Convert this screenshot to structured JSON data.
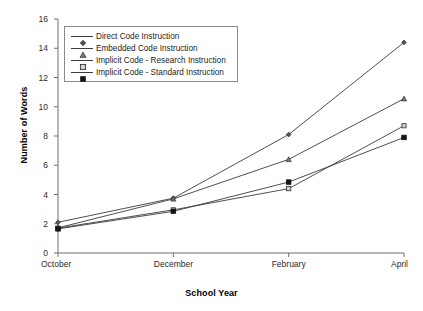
{
  "chart_data": {
    "type": "line",
    "title": "",
    "xlabel": "School Year",
    "ylabel": "Number of Words",
    "categories": [
      "October",
      "December",
      "February",
      "April"
    ],
    "ylim": [
      0,
      16
    ],
    "yticks": [
      0,
      2,
      4,
      6,
      8,
      10,
      12,
      14,
      16
    ],
    "grid": false,
    "legend_position": "upper-left-inside",
    "series": [
      {
        "name": "Direct Code Instruction",
        "marker": "diamond",
        "values": [
          2.1,
          3.75,
          8.1,
          14.4
        ]
      },
      {
        "name": "Embedded Code Instruction",
        "marker": "triangle",
        "values": [
          1.72,
          3.7,
          6.4,
          10.55
        ]
      },
      {
        "name": "Implicit Code - Research Instruction",
        "marker": "open-square",
        "values": [
          1.7,
          2.95,
          4.4,
          8.7
        ]
      },
      {
        "name": "Implicit Code - Standard Instruction",
        "marker": "filled-square",
        "values": [
          1.65,
          2.85,
          4.85,
          7.9
        ]
      }
    ]
  },
  "axes": {
    "y_label": "Number of Words",
    "x_label": "School Year",
    "y_tick_labels": [
      "0",
      "2",
      "4",
      "6",
      "8",
      "10",
      "12",
      "14",
      "16"
    ],
    "x_tick_labels": [
      "October",
      "December",
      "February",
      "April"
    ]
  },
  "legend": {
    "entries": [
      {
        "label": "Direct Code Instruction",
        "marker": "diamond-marker-icon"
      },
      {
        "label": "Embedded Code Instruction",
        "marker": "triangle-marker-icon"
      },
      {
        "label": "Implicit Code - Research Instruction",
        "marker": "open-square-marker-icon"
      },
      {
        "label": "Implicit Code - Standard Instruction",
        "marker": "filled-square-marker-icon"
      }
    ]
  },
  "colors": {
    "line": "#3b3b3b",
    "axis": "#6f6f6f",
    "text": "#1c1c1c",
    "background": "#ffffff",
    "legend_border": "#8a8a8a"
  }
}
